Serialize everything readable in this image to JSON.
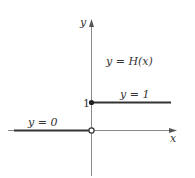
{
  "figure": {
    "function_label": "y = H(x)",
    "axes": {
      "x_label": "x",
      "y_label": "y"
    },
    "ticks": {
      "y_one": "1"
    },
    "segments": [
      {
        "label": "y = 0",
        "from": "-inf",
        "to": 0,
        "value": 0,
        "endpoint_at_zero": "open"
      },
      {
        "label": "y = 1",
        "from": 0,
        "to": "+inf",
        "value": 1,
        "endpoint_at_zero": "closed"
      }
    ],
    "colors": {
      "axis": "#888888",
      "line": "#333333",
      "text": "#333333"
    }
  }
}
